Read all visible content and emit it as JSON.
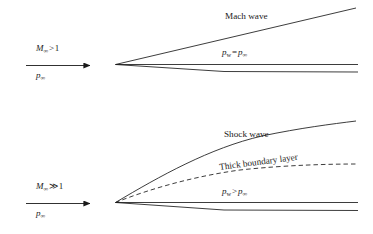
{
  "figure": {
    "type": "schematic",
    "line_color": "#1a1a1a",
    "text_color": "#1a1a1a"
  },
  "panels": [
    {
      "id": "supersonic",
      "inflow": {
        "mach_symbol": "M",
        "mach_subscript": "∞",
        "mach_relation": ">",
        "mach_value": "1",
        "pressure_symbol": "p",
        "pressure_subscript": "∞"
      },
      "wave_label": "Mach wave",
      "wall_pressure": {
        "symbol": "p",
        "subscript": "w",
        "relation": "=",
        "reference_symbol": "p",
        "reference_subscript": "∞"
      },
      "boundary_layer_label": null
    },
    {
      "id": "hypersonic",
      "inflow": {
        "mach_symbol": "M",
        "mach_subscript": "∞",
        "mach_relation": "≫",
        "mach_value": "1",
        "pressure_symbol": "p",
        "pressure_subscript": "∞"
      },
      "wave_label": "Shock wave",
      "wall_pressure": {
        "symbol": "p",
        "subscript": "w",
        "relation": ">",
        "reference_symbol": "p",
        "reference_subscript": "∞"
      },
      "boundary_layer_label": "Thick boundary layer"
    }
  ]
}
